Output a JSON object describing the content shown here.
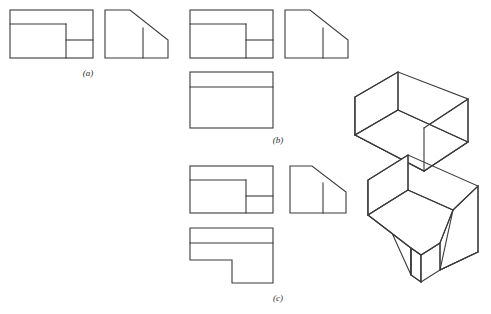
{
  "figure": {
    "kind": "engineering-drawing-plate",
    "background_color": "#ffffff",
    "line_color": "#3a3a3a",
    "face_fill_color": "#ffffff",
    "width": 491,
    "height": 314,
    "captions": [
      {
        "id": "a",
        "label": "(a)",
        "x": 88,
        "y": 76
      },
      {
        "id": "b",
        "label": "(b)",
        "x": 278,
        "y": 143
      },
      {
        "id": "c",
        "label": "(c)",
        "x": 278,
        "y": 301
      }
    ],
    "parts": [
      {
        "id": "a",
        "caption": "(a)",
        "views": [
          {
            "name": "top-view",
            "shape": "rectangle-with-internal-partitions",
            "outline": "10,10 93,10 93,58 10,58",
            "internal_lines": [
              "10,24 66,24",
              "66,24 66,58",
              "66,40 93,40"
            ]
          },
          {
            "name": "side-view",
            "shape": "chamfered-profile",
            "outline": "105,10 130,10 168,40 168,58 105,58",
            "internal_lines": [
              "143,28 143,58"
            ]
          }
        ]
      },
      {
        "id": "b",
        "caption": "(b)",
        "views": [
          {
            "name": "top-view",
            "shape": "rectangle-with-internal-partitions",
            "outline": "190,10 273,10 273,58 190,58",
            "internal_lines": [
              "190,24 246,24",
              "246,24 246,58",
              "246,40 273,40"
            ]
          },
          {
            "name": "front-view",
            "shape": "rectangle-with-top-band",
            "outline": "190,72 273,72 273,128 190,128",
            "internal_lines": [
              "190,87 273,87"
            ]
          },
          {
            "name": "side-view",
            "shape": "chamfered-profile",
            "outline": "285,10 310,10 348,40 348,58 285,58",
            "internal_lines": [
              "323,28 323,58"
            ]
          },
          {
            "name": "isometric-view",
            "shape": "wedge-ramp-solid",
            "faces": [
              {
                "name": "inclined-top-face",
                "points": "355,135 398,110 468,142 424,171"
              },
              {
                "name": "left-end-face",
                "points": "355,135 355,97 398,72 398,110"
              },
              {
                "name": "front-right-face",
                "points": "424,171 468,142 468,99 424,128"
              },
              {
                "name": "lower-left-face",
                "points": "355,135 424,171 424,128 355,97"
              }
            ],
            "edges": [
              "355,97 398,72",
              "398,72 468,99",
              "468,99 468,142",
              "468,142 424,171",
              "424,171 355,135",
              "355,135 355,97",
              "398,72 398,110",
              "398,110 468,142",
              "398,110 355,135",
              "424,171 424,128",
              "424,128 468,99"
            ]
          }
        ]
      },
      {
        "id": "c",
        "caption": "(c)",
        "views": [
          {
            "name": "top-view",
            "shape": "rectangle-with-internal-partitions",
            "outline": "190,166 273,166 273,213 190,213",
            "internal_lines": [
              "190,180 246,180",
              "246,180 246,213",
              "246,196 273,196"
            ]
          },
          {
            "name": "front-view",
            "shape": "l-shaped-notched-profile",
            "outline": "190,228 273,228 273,283 232,283 232,260 190,260",
            "internal_lines": [
              "190,243 273,243"
            ]
          },
          {
            "name": "side-view",
            "shape": "chamfered-profile",
            "outline": "290,166 312,166 346,192 346,213 290,213",
            "internal_lines": [
              "323,183 323,213"
            ]
          },
          {
            "name": "isometric-view",
            "shape": "wedge-ramp-with-notch-solid",
            "faces": [
              {
                "name": "inclined-top-face",
                "points": "368,215 408,190 453,210 440,218 440,243 421,255 411,248"
              },
              {
                "name": "left-end-face",
                "points": "368,215 368,180 408,155 408,190"
              },
              {
                "name": "lower-left-face",
                "points": "368,215 411,248 411,248 368,180"
              },
              {
                "name": "notch-inner-left",
                "points": "411,248 421,255 421,282 411,275"
              },
              {
                "name": "notch-inner-back",
                "points": "421,255 440,243 440,270 421,282"
              },
              {
                "name": "right-block-front",
                "points": "440,243 453,210 478,222 478,252"
              },
              {
                "name": "right-block-side",
                "points": "453,210 478,222 478,252 440,270"
              }
            ],
            "edges": [
              "368,180 408,155",
              "408,155 478,186",
              "478,186 478,252",
              "478,252 440,270",
              "440,270 440,243",
              "440,243 421,255",
              "421,255 421,282",
              "421,282 411,275",
              "411,275 411,248",
              "411,248 368,215",
              "368,215 368,180",
              "408,155 408,190",
              "408,190 453,210",
              "453,210 478,186",
              "408,190 368,215",
              "453,210 440,243",
              "411,248 421,255",
              "440,243 440,270",
              "478,222 478,252",
              "453,210 478,222",
              "440,270 478,252"
            ]
          }
        ]
      }
    ]
  }
}
